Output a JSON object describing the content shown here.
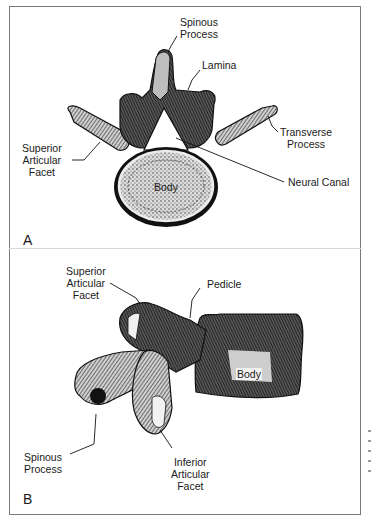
{
  "figure": {
    "panels": [
      {
        "letter": "A",
        "view": "superior view of lumbar vertebra",
        "labels": {
          "spinous_process": [
            "Spinous",
            "Process"
          ],
          "lamina": [
            "Lamina"
          ],
          "transverse_process": [
            "Transverse",
            "Process"
          ],
          "superior_articular_facet": [
            "Superior",
            "Articular",
            "Facet"
          ],
          "neural_canal": [
            "Neural Canal"
          ],
          "body": [
            "Body"
          ]
        }
      },
      {
        "letter": "B",
        "view": "lateral view of lumbar vertebra",
        "labels": {
          "superior_articular_facet": [
            "Superior",
            "Articular",
            "Facet"
          ],
          "pedicle": [
            "Pedicle"
          ],
          "body": [
            "Body"
          ],
          "spinous_process": [
            "Spinous",
            "Process"
          ],
          "inferior_articular_facet": [
            "Inferior",
            "Articular",
            "Facet"
          ]
        }
      }
    ],
    "colors": {
      "frame": "#7a7a7a",
      "ink": "#1a1a1a",
      "bone_light": "#e8e8e8",
      "bone_shade": "#3a3a3a",
      "background": "#ffffff"
    }
  }
}
